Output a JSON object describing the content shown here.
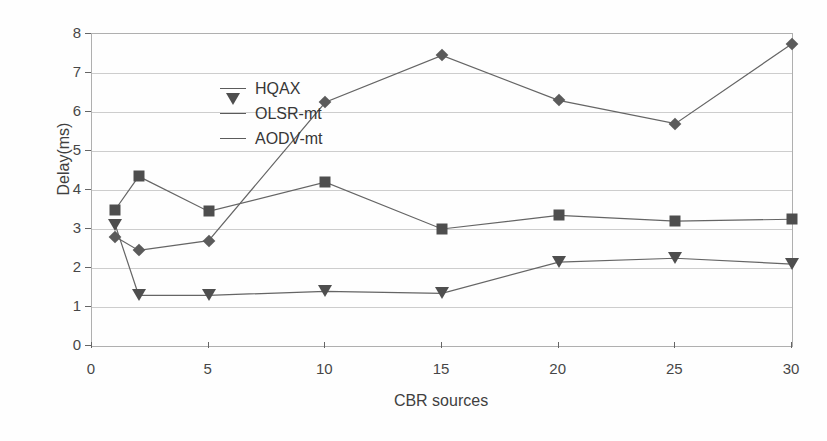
{
  "chart_data": {
    "type": "line",
    "title": "",
    "xlabel": "CBR sources",
    "ylabel": "Delay(ms)",
    "xlim": [
      0,
      30
    ],
    "ylim": [
      0,
      8
    ],
    "x": [
      1,
      2,
      5,
      10,
      15,
      20,
      25,
      30
    ],
    "xticks": [
      "0",
      "5",
      "10",
      "15",
      "20",
      "25",
      "30"
    ],
    "xtick_values": [
      0,
      5,
      10,
      15,
      20,
      25,
      30
    ],
    "yticks": [
      "0",
      "1",
      "2",
      "3",
      "4",
      "5",
      "6",
      "7",
      "8"
    ],
    "ytick_values": [
      0,
      1,
      2,
      3,
      4,
      5,
      6,
      7,
      8
    ],
    "grid": "horizontal",
    "legend_position": "top-left-inside",
    "series": [
      {
        "name": "HQAX",
        "marker": "square",
        "color": "#3c3c3c",
        "values": [
          3.5,
          4.35,
          3.45,
          4.2,
          3.0,
          3.35,
          3.2,
          3.25
        ]
      },
      {
        "name": "OLSR-mt",
        "marker": "triangle-down",
        "color": "#3c3c3c",
        "values": [
          3.1,
          1.3,
          1.3,
          1.4,
          1.35,
          2.15,
          2.25,
          2.1
        ]
      },
      {
        "name": "AODV-mt",
        "marker": "diamond",
        "color": "#4a4a4a",
        "values": [
          2.8,
          2.45,
          2.7,
          6.25,
          7.45,
          6.3,
          5.7,
          7.75
        ]
      }
    ]
  },
  "legend": {
    "items": [
      {
        "label": "HQAX"
      },
      {
        "label": "OLSR-mt"
      },
      {
        "label": "AODV-mt"
      }
    ]
  },
  "axes": {
    "y_title": "Delay(ms)",
    "x_title": "CBR sources"
  }
}
